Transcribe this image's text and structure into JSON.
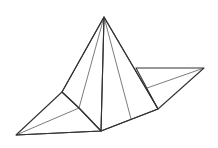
{
  "figure": {
    "colors": {
      "background": "#ffffff",
      "light_face": "#e2e2e2",
      "shaded_face": "#c4c4c4",
      "white_face": "#ffffff",
      "edge": "#333333"
    },
    "faces": [
      {
        "name": "left-flap",
        "shade": "light"
      },
      {
        "name": "left-pyramid-face",
        "shade": "shaded"
      },
      {
        "name": "front-pyramid-face",
        "shade": "white"
      },
      {
        "name": "right-flap",
        "shade": "light"
      }
    ]
  }
}
